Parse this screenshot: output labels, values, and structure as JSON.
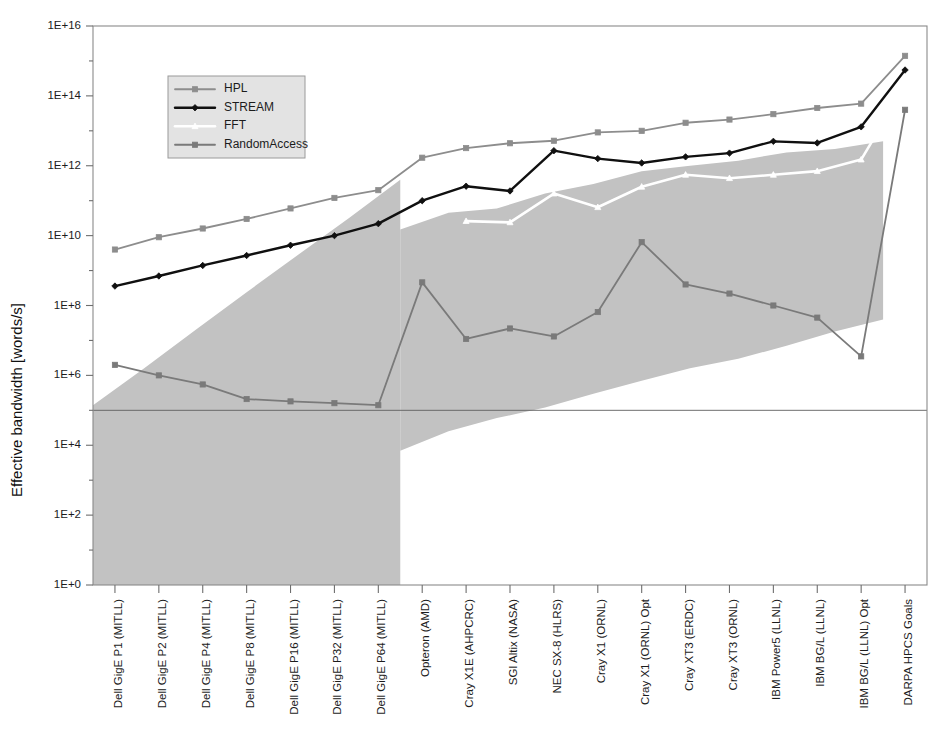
{
  "chart_data": {
    "type": "line",
    "title": "",
    "xlabel": "",
    "ylabel": "Effective bandwidth [words/s]",
    "yscale": "log",
    "ylim": [
      1,
      1e+16
    ],
    "ytick_labels": [
      "1E+0",
      "1E+2",
      "1E+4",
      "1E+6",
      "1E+8",
      "1E+10",
      "1E+12",
      "1E+14",
      "1E+16"
    ],
    "ytick_values": [
      1,
      100,
      10000,
      1000000,
      100000000,
      10000000000,
      1000000000000,
      100000000000000,
      1e+16
    ],
    "grid": false,
    "legend_position": "upper-left-inside",
    "categories": [
      "Dell GigE P1 (MITLL)",
      "Dell GigE P2 (MITLL)",
      "Dell GigE P4 (MITLL)",
      "Dell GigE P8 (MITLL)",
      "Dell GigE P16 (MITLL)",
      "Dell GigE P32 (MITLL)",
      "Dell GigE P64 (MITLL)",
      "Opteron (AMD)",
      "Cray X1E (AHPCRC)",
      "SGI Altix (NASA)",
      "NEC SX-8 (HLRS)",
      "Cray X1 (ORNL)",
      "Cray X1 (ORNL) Opt",
      "Cray XT3 (ERDC)",
      "Cray XT3 (ORNL)",
      "IBM Power5 (LLNL)",
      "IBM BG/L (LLNL)",
      "IBM BG/L (LLNL) Opt",
      "DARPA HPCS Goals"
    ],
    "series": [
      {
        "name": "HPL",
        "color": "#8d8d8d",
        "marker": "square",
        "linewidth": 1.8,
        "values": [
          4000000000.0,
          9000000000.0,
          16000000000.0,
          30000000000.0,
          60000000000.0,
          120000000000.0,
          200000000000.0,
          1700000000000.0,
          3200000000000.0,
          4400000000000.0,
          5200000000000.0,
          9000000000000.0,
          10000000000000.0,
          17000000000000.0,
          21000000000000.0,
          30000000000000.0,
          45000000000000.0,
          60000000000000.0,
          1400000000000000.0
        ]
      },
      {
        "name": "STREAM",
        "color": "#101010",
        "marker": "diamond",
        "linewidth": 2.4,
        "values": [
          360000000.0,
          700000000.0,
          1400000000.0,
          2700000000.0,
          5300000000.0,
          10000000000.0,
          22000000000.0,
          100000000000.0,
          260000000000.0,
          190000000000.0,
          2700000000000.0,
          1600000000000.0,
          1200000000000.0,
          1800000000000.0,
          2300000000000.0,
          5000000000000.0,
          4500000000000.0,
          13000000000000.0,
          550000000000000.0
        ]
      },
      {
        "name": "FFT",
        "color": "#ffffff",
        "marker": "triangle",
        "linewidth": 2.6,
        "values": [
          null,
          null,
          null,
          null,
          null,
          null,
          null,
          null,
          26000000000.0,
          24000000000.0,
          160000000000.0,
          65000000000.0,
          250000000000.0,
          550000000000.0,
          440000000000.0,
          550000000000.0,
          700000000000.0,
          1500000000000.0,
          190000000000000.0
        ]
      },
      {
        "name": "RandomAccess",
        "color": "#7a7a7a",
        "marker": "square",
        "linewidth": 1.8,
        "values": [
          2000000.0,
          1000000.0,
          550000.0,
          210000.0,
          180000.0,
          160000.0,
          140000.0,
          460000000.0,
          11000000.0,
          22000000.0,
          13000000.0,
          65000000.0,
          6500000000.0,
          400000000.0,
          220000000.0,
          100000000.0,
          45000000.0,
          3500000.0,
          40000000000000.0
        ]
      }
    ],
    "bands": [
      {
        "name": "mitll-cluster-spread-band",
        "color": "#c2c2c2",
        "note": "shaded wedge over Dell GigE systems",
        "upper": [
          140000.0,
          1600000.0,
          20000000.0,
          240000000.0,
          2800000000.0,
          32000000000.0,
          400000000000.0
        ],
        "lower": [
          1.0,
          1.0,
          1.0,
          1.0,
          1.0,
          1.0,
          1.0
        ],
        "x_from_index": 0,
        "x_to_index": 6
      },
      {
        "name": "hpc-platform-spread-band",
        "color": "#c2c2c2",
        "note": "shaded wedge over HPC platforms",
        "upper": [
          15000000000.0,
          45000000000.0,
          60000000000.0,
          160000000000.0,
          300000000000.0,
          700000000000.0,
          1000000000000.0,
          1400000000000.0,
          2400000000000.0,
          3000000000000.0,
          5000000000000.0
        ],
        "lower": [
          7000.0,
          25000.0,
          60000.0,
          120000.0,
          300000.0,
          700000.0,
          1600000.0,
          3000000.0,
          7000000.0,
          18000000.0,
          40000000.0
        ],
        "x_from_index": 7,
        "x_to_index": 17
      }
    ],
    "reference_lines": [
      {
        "name": "baseline-reference",
        "orientation": "horizontal",
        "value": 100000,
        "color": "#5d5d5d"
      }
    ],
    "annotations": []
  },
  "legend": {
    "entries": [
      {
        "label": "HPL"
      },
      {
        "label": "STREAM"
      },
      {
        "label": "FFT"
      },
      {
        "label": "RandomAccess"
      }
    ]
  },
  "colors": {
    "hpl": "#8d8d8d",
    "stream": "#101010",
    "fft": "#ffffff",
    "randomaccess": "#7a7a7a",
    "band": "#c2c2c2",
    "axis": "#8a8a8a",
    "text": "#1c1c1c"
  }
}
